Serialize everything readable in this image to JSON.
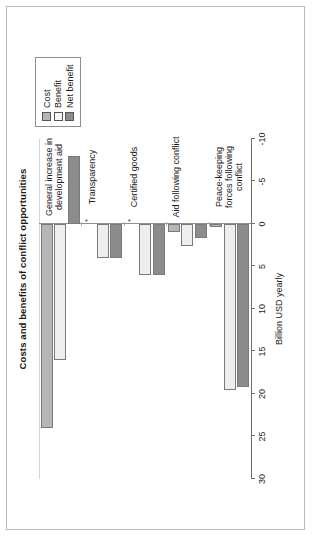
{
  "chart_data": {
    "type": "bar",
    "orientation": "vertical-grouped",
    "title": "Costs and benefits of conflict opportunities",
    "xlabel": "",
    "ylabel": "Billion USD yearly",
    "ylim": [
      -10,
      30
    ],
    "yticks": [
      30,
      25,
      20,
      15,
      10,
      5,
      0,
      -5,
      -10
    ],
    "ytick_labels": [
      "30",
      "25",
      "20",
      "15",
      "10",
      "5",
      "0",
      "-5",
      "-10"
    ],
    "grid": false,
    "legend_position": "top-left",
    "categories": [
      "General increase in development aid",
      "Transparency",
      "Certified goods",
      "Aid following conflict",
      "Peace-keeping forces following conflict"
    ],
    "series": [
      {
        "name": "Cost",
        "color": "#b6b6b6",
        "values": [
          24.0,
          0.0,
          0.0,
          1.0,
          0.3
        ]
      },
      {
        "name": "Benefit",
        "color": "#eeeeee",
        "values": [
          16.0,
          4.0,
          6.0,
          2.6,
          19.5
        ]
      },
      {
        "name": "Net benefit",
        "color": "#8c8c8c",
        "values": [
          -8.0,
          4.0,
          6.0,
          1.6,
          19.2
        ]
      }
    ],
    "annotations": [
      {
        "category": "Transparency",
        "series": "Cost",
        "marker": "*"
      },
      {
        "category": "Certified goods",
        "series": "Cost",
        "marker": "*"
      }
    ],
    "footnote": "*) The costs are difficult to quantify and is largely made up of the opportunity costs by not investing the funds in other international issues."
  },
  "legend": {
    "items": [
      {
        "label": "Cost"
      },
      {
        "label": "Benefit"
      },
      {
        "label": "Net benefit"
      }
    ]
  }
}
